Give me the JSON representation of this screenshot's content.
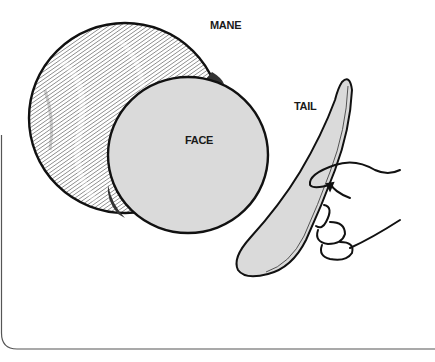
{
  "diagram": {
    "labels": {
      "mane": "MANE",
      "face": "FACE",
      "tail": "TAIL"
    },
    "parts": [
      {
        "id": "mane",
        "shape": "hatched-circle",
        "fill": "hatched"
      },
      {
        "id": "face",
        "shape": "circle",
        "fill": "#dadada"
      },
      {
        "id": "tail",
        "shape": "curved-strip",
        "fill": "#dadada"
      },
      {
        "id": "hand",
        "shape": "outline",
        "fill": "#ffffff"
      }
    ],
    "colors": {
      "line": "#1a1a1a",
      "face_fill": "#dadada",
      "tail_fill": "#dadada",
      "background": "#ffffff"
    }
  }
}
